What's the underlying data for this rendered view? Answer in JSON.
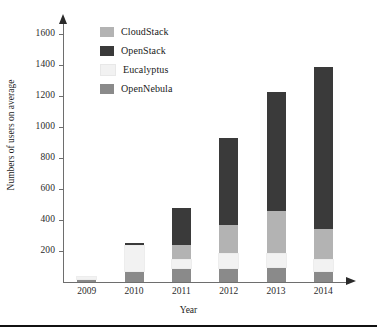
{
  "chart_data": {
    "type": "bar",
    "subtype": "stacked-bar",
    "title": "",
    "xlabel": "Year",
    "ylabel": "Numbers of users on average",
    "categories": [
      "2009",
      "2010",
      "2011",
      "2012",
      "2013",
      "2014"
    ],
    "ylim": [
      0,
      1700
    ],
    "yticks": [
      200,
      400,
      600,
      800,
      1000,
      1200,
      1400,
      1600
    ],
    "ytick_labels": [
      "200",
      "400",
      "600",
      "800",
      "1000",
      "1200",
      "1400",
      "1600"
    ],
    "grid": false,
    "legend_position": "top-left-inside",
    "stack_order_bottom_to_top": [
      "OpenNebula",
      "Eucalyptus",
      "CloudStack",
      "OpenStack"
    ],
    "series": [
      {
        "name": "CloudStack",
        "color": "#b3b3b3",
        "values": [
          0,
          0,
          100,
          190,
          280,
          200
        ]
      },
      {
        "name": "OpenStack",
        "color": "#3a3a3a",
        "values": [
          0,
          15,
          240,
          560,
          765,
          1045
        ]
      },
      {
        "name": "Eucalyptus",
        "color": "#f2f2f2",
        "values": [
          10,
          165,
          50,
          90,
          85,
          70
        ]
      },
      {
        "name": "OpenNebula",
        "color": "#8a8a8a",
        "values": [
          20,
          70,
          90,
          90,
          95,
          70
        ]
      }
    ],
    "totals": [
      30,
      250,
      480,
      930,
      1225,
      1385
    ]
  },
  "legend": {
    "items": [
      {
        "label": "CloudStack",
        "color": "#b3b3b3"
      },
      {
        "label": "OpenStack",
        "color": "#3a3a3a"
      },
      {
        "label": "Eucalyptus",
        "color": "#f2f2f2"
      },
      {
        "label": "OpenNebula",
        "color": "#8a8a8a"
      }
    ]
  },
  "axes": {
    "x_title": "Year",
    "y_title": "Numbers of users on average"
  },
  "colors": {
    "axis": "#6e6e6e",
    "arrow": "#2a2a2a",
    "text": "#1c1c1c",
    "footer_rule": "#111111",
    "background": "#ffffff"
  }
}
